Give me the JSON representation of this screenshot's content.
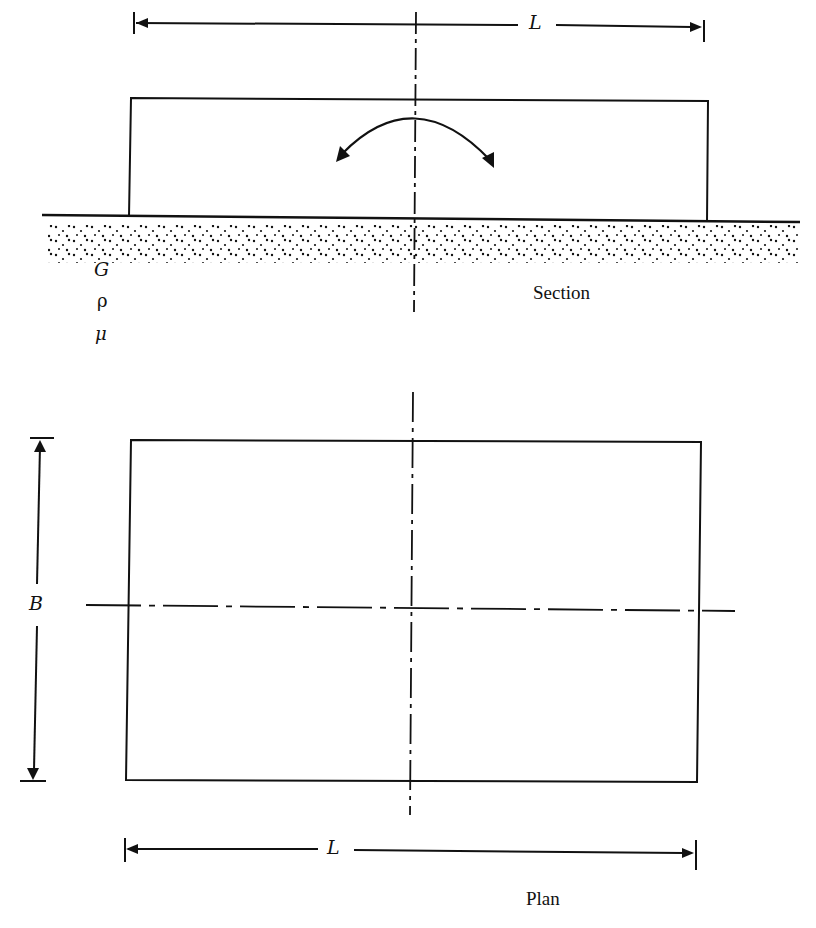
{
  "figure": {
    "section": {
      "caption": "Section",
      "dimension_label": "L",
      "soil_properties": [
        "G",
        "ρ",
        "μ"
      ],
      "moment_arrow": "rocking moment about centerline"
    },
    "plan": {
      "caption": "Plan",
      "length_label": "L",
      "width_label": "B"
    },
    "colors": {
      "line": "#111111",
      "background": "#ffffff"
    }
  }
}
